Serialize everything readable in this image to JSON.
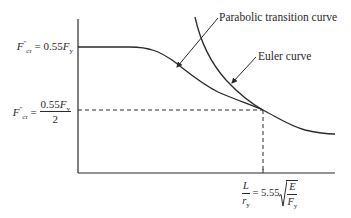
{
  "diagram": {
    "type": "column-strength-curve",
    "y_axis": {
      "upper_label": {
        "lhs_symbol": "F",
        "lhs_superscript": "″",
        "lhs_subscript": "cr",
        "equals": "=",
        "coefficient": "0.55",
        "rhs_symbol": "F",
        "rhs_subscript": "y"
      },
      "lower_label": {
        "lhs_symbol": "F",
        "lhs_superscript": "″",
        "lhs_subscript": "cr",
        "equals": "=",
        "numerator_coefficient": "0.55",
        "numerator_symbol": "F",
        "numerator_subscript": "y",
        "denominator": "2"
      }
    },
    "x_axis": {
      "marker_label": {
        "ratio_numerator": "L",
        "ratio_denominator_symbol": "r",
        "ratio_denominator_subscript": "y",
        "equals": "=",
        "coefficient": "5.55",
        "sqrt_numerator": "E",
        "sqrt_denominator_symbol": "F",
        "sqrt_denominator_subscript": "y"
      }
    },
    "annotations": {
      "parabolic": "Parabolic transition curve",
      "euler": "Euler curve"
    },
    "colors": {
      "line": "#2a2a2a",
      "background": "#ffffff"
    }
  }
}
